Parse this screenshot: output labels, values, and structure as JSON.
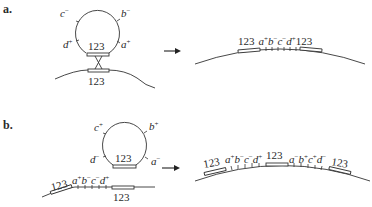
{
  "figure": {
    "panels": [
      {
        "label": "a.",
        "loop": {
          "site_label": "123",
          "segments": [
            {
              "name": "c",
              "sign": "−"
            },
            {
              "name": "b",
              "sign": "−"
            },
            {
              "name": "d",
              "sign": "+"
            },
            {
              "name": "a",
              "sign": "+"
            }
          ]
        },
        "chromosome_site_label": "123",
        "product": {
          "left_site": "123",
          "segments": [
            {
              "name": "a",
              "sign": "+"
            },
            {
              "name": "b",
              "sign": "−"
            },
            {
              "name": "c",
              "sign": "−"
            },
            {
              "name": "d",
              "sign": "+"
            }
          ],
          "right_site": "123"
        }
      },
      {
        "label": "b.",
        "loop": {
          "site_label": "123",
          "segments": [
            {
              "name": "c",
              "sign": "+"
            },
            {
              "name": "b",
              "sign": "+"
            },
            {
              "name": "d",
              "sign": "−"
            },
            {
              "name": "a",
              "sign": "−"
            }
          ]
        },
        "chromosome": {
          "left_site": "123",
          "segments": [
            {
              "name": "a",
              "sign": "+"
            },
            {
              "name": "b",
              "sign": "−"
            },
            {
              "name": "c",
              "sign": "−"
            },
            {
              "name": "d",
              "sign": "+"
            }
          ],
          "right_site": "123"
        },
        "product": {
          "left_site": "123",
          "segments_1": [
            {
              "name": "a",
              "sign": "+"
            },
            {
              "name": "b",
              "sign": "−"
            },
            {
              "name": "c",
              "sign": "−"
            },
            {
              "name": "d",
              "sign": "+"
            }
          ],
          "middle_site": "123",
          "segments_2": [
            {
              "name": "a",
              "sign": "−"
            },
            {
              "name": "b",
              "sign": "+"
            },
            {
              "name": "c",
              "sign": "+"
            },
            {
              "name": "d",
              "sign": "−"
            }
          ],
          "right_site": "123"
        }
      }
    ]
  }
}
